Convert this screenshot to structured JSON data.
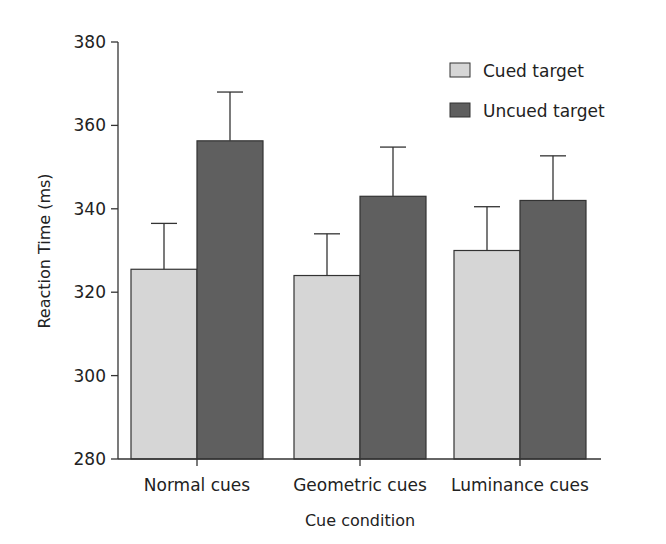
{
  "chart_data": {
    "type": "bar",
    "title": "",
    "xlabel": "Cue condition",
    "ylabel": "Reaction Time (ms)",
    "ylim": [
      280,
      380
    ],
    "yticks": [
      280,
      300,
      320,
      340,
      360,
      380
    ],
    "grid": false,
    "legend_position": "top-right",
    "categories": [
      "Normal cues",
      "Geometric cues",
      "Luminance cues"
    ],
    "series": [
      {
        "name": "Cued target",
        "color": "#d6d6d6",
        "values": [
          325.5,
          324.0,
          330.0
        ],
        "error": [
          11.0,
          10.0,
          10.5
        ]
      },
      {
        "name": "Uncued target",
        "color": "#5f5f5f",
        "values": [
          356.3,
          343.0,
          342.0
        ],
        "error": [
          11.7,
          11.8,
          10.7
        ]
      }
    ]
  }
}
